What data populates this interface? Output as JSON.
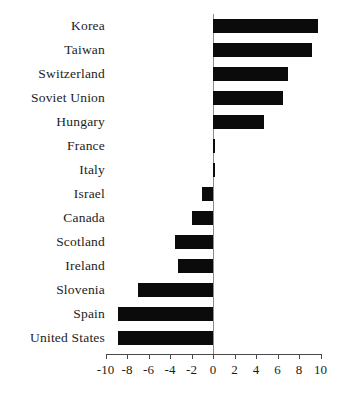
{
  "chart_data": {
    "type": "bar",
    "orientation": "horizontal",
    "title": "",
    "xlabel": "",
    "ylabel": "",
    "xlim": [
      -10,
      10
    ],
    "xticks": [
      -10,
      -8,
      -6,
      -4,
      -2,
      0,
      2,
      4,
      6,
      8,
      10
    ],
    "xtick_labels": [
      "-10",
      "-8",
      "-6",
      "-4",
      "-2",
      "0",
      "2",
      "4",
      "6",
      "8",
      "10"
    ],
    "grid": false,
    "legend": null,
    "bar_color": "#0b0b0b",
    "axis_color": "#4a4a4a",
    "zero_line_color": "#8c8c8c",
    "categories": [
      "Korea",
      "Taiwan",
      "Switzerland",
      "Soviet Union",
      "Hungary",
      "France",
      "Italy",
      "Israel",
      "Canada",
      "Scotland",
      "Ireland",
      "Slovenia",
      "Spain",
      "United States"
    ],
    "values": [
      9.8,
      9.2,
      7.0,
      6.5,
      4.7,
      0.2,
      0.1,
      -1.0,
      -2.0,
      -3.5,
      -3.3,
      -7.0,
      -8.8,
      -8.8
    ]
  }
}
